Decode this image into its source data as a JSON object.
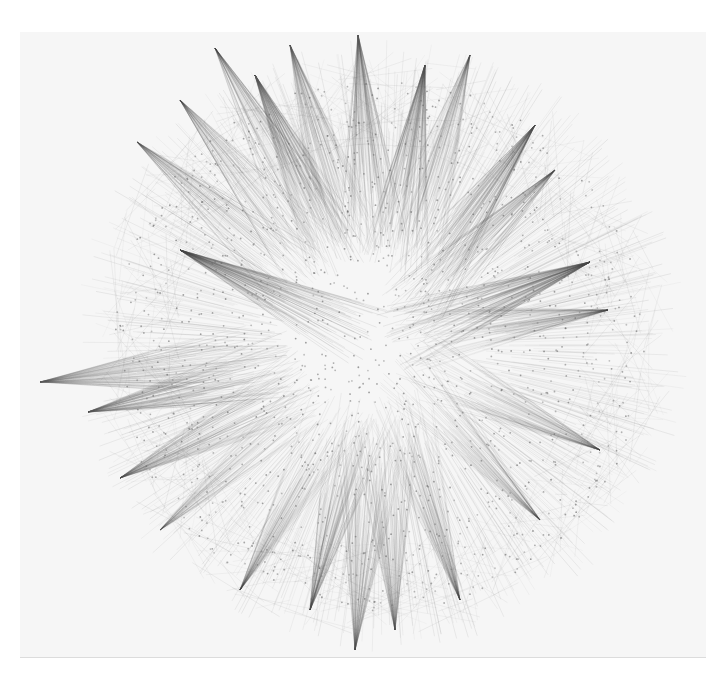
{
  "figure": {
    "type": "network-graph",
    "layout": "radial-force",
    "background": "#ffffff",
    "panel_color": "#f6f6f6",
    "edge_color": "#555555",
    "node_color": "#666666",
    "center": [
      380,
      345
    ],
    "inner_radius": 150,
    "outer_radius": 280,
    "labels": []
  },
  "hubs": [
    {
      "x": 358,
      "y": 35,
      "a": 0.75
    },
    {
      "x": 290,
      "y": 45,
      "a": 0.6
    },
    {
      "x": 255,
      "y": 75,
      "a": 0.85
    },
    {
      "x": 215,
      "y": 48,
      "a": 0.5
    },
    {
      "x": 425,
      "y": 65,
      "a": 0.8
    },
    {
      "x": 470,
      "y": 55,
      "a": 0.5
    },
    {
      "x": 535,
      "y": 125,
      "a": 0.85
    },
    {
      "x": 555,
      "y": 170,
      "a": 0.6
    },
    {
      "x": 590,
      "y": 262,
      "a": 0.95
    },
    {
      "x": 608,
      "y": 310,
      "a": 0.5
    },
    {
      "x": 180,
      "y": 250,
      "a": 0.95
    },
    {
      "x": 40,
      "y": 382,
      "a": 0.7
    },
    {
      "x": 88,
      "y": 412,
      "a": 0.7
    },
    {
      "x": 120,
      "y": 478,
      "a": 0.6
    },
    {
      "x": 137,
      "y": 142,
      "a": 0.55
    },
    {
      "x": 180,
      "y": 100,
      "a": 0.5
    },
    {
      "x": 600,
      "y": 450,
      "a": 0.45
    },
    {
      "x": 540,
      "y": 520,
      "a": 0.45
    },
    {
      "x": 310,
      "y": 610,
      "a": 0.6
    },
    {
      "x": 355,
      "y": 650,
      "a": 0.6
    },
    {
      "x": 395,
      "y": 630,
      "a": 0.55
    },
    {
      "x": 240,
      "y": 590,
      "a": 0.45
    },
    {
      "x": 460,
      "y": 600,
      "a": 0.45
    },
    {
      "x": 160,
      "y": 530,
      "a": 0.4
    }
  ]
}
